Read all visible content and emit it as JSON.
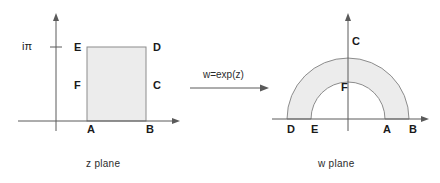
{
  "figure": {
    "background": "#ffffff",
    "stroke": "#5a5a5a",
    "fill": "#ececec",
    "fill_stroke": "#8c8c8c"
  },
  "z_plane": {
    "caption": "z plane",
    "axis_tick_label": "iπ",
    "region_type": "rectangle",
    "vertices": [
      {
        "id": "A",
        "label": "A",
        "x": 87,
        "y": 131
      },
      {
        "id": "B",
        "label": "B",
        "x": 146,
        "y": 131
      },
      {
        "id": "C",
        "label": "C",
        "x": 153,
        "y": 86
      },
      {
        "id": "D",
        "label": "D",
        "x": 153,
        "y": 48
      },
      {
        "id": "E",
        "label": "E",
        "x": 74,
        "y": 48
      },
      {
        "id": "F",
        "label": "F",
        "x": 74,
        "y": 86
      }
    ]
  },
  "mapping": {
    "label": "w=exp(z)",
    "arrow": "right-arrow"
  },
  "w_plane": {
    "caption": "w plane",
    "region_type": "half-annulus",
    "vertices": [
      {
        "id": "D",
        "label": "D",
        "x": 287,
        "y": 131
      },
      {
        "id": "E",
        "label": "E",
        "x": 311,
        "y": 131
      },
      {
        "id": "F",
        "label": "F",
        "x": 341,
        "y": 88
      },
      {
        "id": "C",
        "label": "C",
        "x": 352,
        "y": 48
      },
      {
        "id": "A",
        "label": "A",
        "x": 383,
        "y": 131
      },
      {
        "id": "B",
        "label": "B",
        "x": 409,
        "y": 131
      }
    ]
  }
}
